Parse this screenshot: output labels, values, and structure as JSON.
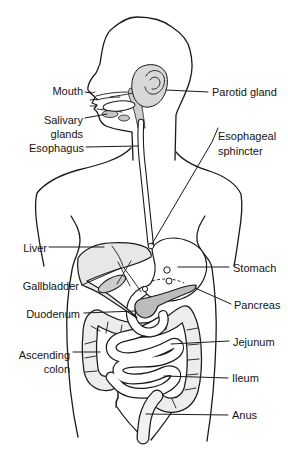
{
  "figure": {
    "labels": {
      "mouth": "Mouth",
      "salivary_1": "Salivary",
      "salivary_2": "glands",
      "esophagus": "Esophagus",
      "parotid": "Parotid gland",
      "sphincter_1": "Esophageal",
      "sphincter_2": "sphincter",
      "liver": "Liver",
      "stomach": "Stomach",
      "gallbladder": "Gallbladder",
      "pancreas": "Pancreas",
      "duodenum": "Duodenum",
      "jejunum": "Jejunum",
      "ascending_1": "Ascending",
      "ascending_2": "colon",
      "ileum": "Ileum",
      "anus": "Anus"
    },
    "colors": {
      "background": "#ffffff",
      "outline": "#1a1a1a",
      "liver": "#e7e7e7",
      "parotid": "#d8d8d8",
      "salivary": "#c6c6c6",
      "pharynx": "#cfcfcf",
      "gallbladder": "#cccccc",
      "pancreas": "#bcbcbc",
      "colon": "#ededed",
      "rectum": "#f1f1f1",
      "bowel": "#ffffff"
    }
  }
}
